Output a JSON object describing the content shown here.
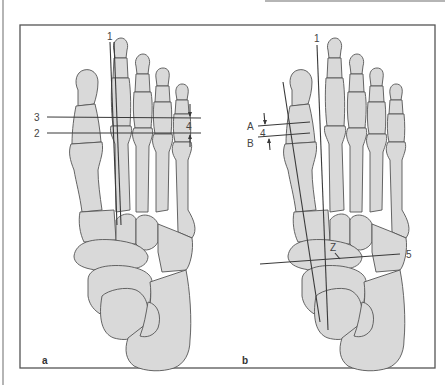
{
  "figure": {
    "type": "anatomical-illustration",
    "colors": {
      "bone_fill": "#d9d9d9",
      "bone_outline": "#555555",
      "lines": "#3a3a3a",
      "frame": "#555555",
      "background": "#ffffff"
    },
    "panels": [
      {
        "id": "a",
        "label": "a",
        "annotations": {
          "axis_1": "1",
          "line_2": "2",
          "line_3": "3",
          "distance_4": "4"
        }
      },
      {
        "id": "b",
        "label": "b",
        "annotations": {
          "axis_1": "1",
          "line_A": "A",
          "line_B": "B",
          "distance_4": "4",
          "point_Z": "Z",
          "line_5": "5"
        }
      }
    ]
  }
}
